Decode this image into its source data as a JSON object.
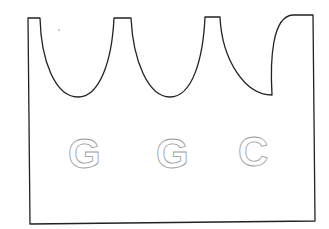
{
  "diagram": {
    "type": "cut-out shape outline with hollow letters",
    "letters": [
      "G",
      "G",
      "C"
    ],
    "colors": {
      "outline": "#222222",
      "letter_stroke": "#9a9a9a",
      "background": "#ffffff"
    }
  }
}
